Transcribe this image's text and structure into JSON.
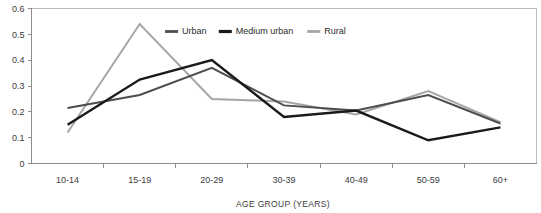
{
  "chart_data": {
    "type": "line",
    "title": "",
    "xlabel": "AGE GROUP (YEARS)",
    "ylabel": "",
    "categories": [
      "10-14",
      "15-19",
      "20-29",
      "30-39",
      "40-49",
      "50-59",
      "60+"
    ],
    "ylim": [
      0,
      0.6
    ],
    "yticks": [
      0,
      0.1,
      0.2,
      0.3,
      0.4,
      0.5,
      0.6
    ],
    "ytick_labels": [
      "0",
      "0.1",
      "0.2",
      "0.3",
      "0.4",
      "0.5",
      "0.6"
    ],
    "grid": false,
    "legend_position": "top-center",
    "series": [
      {
        "name": "Urban",
        "color": "#4d4d4d",
        "values": [
          0.215,
          0.265,
          0.37,
          0.225,
          0.205,
          0.265,
          0.155
        ]
      },
      {
        "name": "Medium urban",
        "color": "#1a1a1a",
        "values": [
          0.15,
          0.325,
          0.4,
          0.18,
          0.205,
          0.09,
          0.14
        ]
      },
      {
        "name": "Rural",
        "color": "#a6a6a6",
        "values": [
          0.12,
          0.54,
          0.25,
          0.24,
          0.19,
          0.28,
          0.16
        ]
      }
    ]
  },
  "colors": {
    "axis": "#8c8c8c",
    "frame": "#bdbdbd",
    "text": "#3b3b3b",
    "background": "#ffffff"
  }
}
